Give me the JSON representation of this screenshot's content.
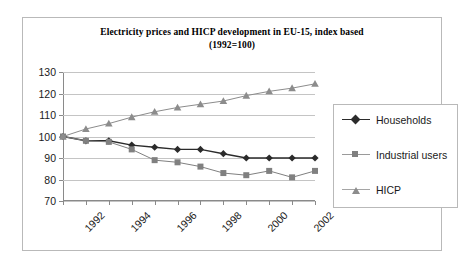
{
  "figure": {
    "title_line1": "Electricity prices and HICP development in EU-15, index based",
    "title_line2": "(1992=100)"
  },
  "legend": {
    "position": "right",
    "items": [
      {
        "label": "Households",
        "marker": "diamond-marker",
        "color": "#2b2b2b"
      },
      {
        "label": "Industrial users",
        "marker": "square-marker",
        "color": "#808080"
      },
      {
        "label": "HICP",
        "marker": "triangle-marker",
        "color": "#8c8c8c"
      }
    ]
  },
  "chart_data": {
    "type": "line",
    "title": "Electricity prices and HICP development in EU-15, index based (1992=100)",
    "xlabel": "",
    "ylabel": "",
    "x": [
      1992,
      1993,
      1994,
      1995,
      1996,
      1997,
      1998,
      1999,
      2000,
      2001,
      2002,
      2003
    ],
    "categories": [
      "1992",
      "1993",
      "1994",
      "1995",
      "1996",
      "1997",
      "1998",
      "1999",
      "2000",
      "2001",
      "2002",
      "2003"
    ],
    "xtick_labels": [
      "1992",
      "1994",
      "1996",
      "1998",
      "2000",
      "2002"
    ],
    "xtick_values": [
      1992,
      1994,
      1996,
      1998,
      2000,
      2002
    ],
    "ytick_labels": [
      "70",
      "80",
      "90",
      "100",
      "110",
      "120",
      "130"
    ],
    "ytick_values": [
      70,
      80,
      90,
      100,
      110,
      120,
      130
    ],
    "ylim": [
      70,
      130
    ],
    "xlim": [
      1992,
      2003
    ],
    "grid": true,
    "series": [
      {
        "name": "Households",
        "marker": "diamond-marker",
        "color": "#2b2b2b",
        "values": [
          100,
          98,
          98,
          96,
          95,
          94,
          94,
          92,
          90,
          90,
          90,
          90
        ]
      },
      {
        "name": "Industrial users",
        "marker": "square-marker",
        "color": "#808080",
        "values": [
          100,
          98,
          97.5,
          94,
          89,
          88,
          86,
          83,
          82,
          84,
          81,
          84
        ]
      },
      {
        "name": "HICP",
        "marker": "triangle-marker",
        "color": "#8c8c8c",
        "values": [
          100,
          103.5,
          106,
          109,
          111.5,
          113.5,
          115,
          116.5,
          119,
          121,
          122.5,
          124.5
        ]
      }
    ]
  }
}
